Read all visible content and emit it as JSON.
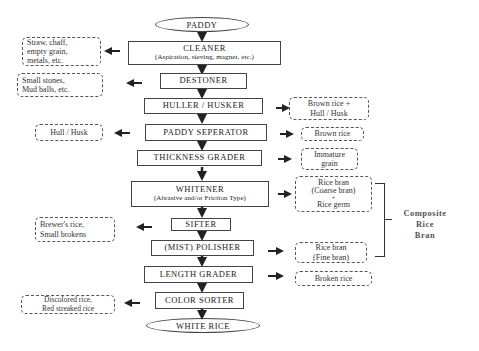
{
  "diagram": {
    "start": "PADDY",
    "end": "WHITE RICE",
    "steps": [
      {
        "name": "CLEANER",
        "sub": "(Aspiration, sieving, magnet, etc.)"
      },
      {
        "name": "DESTONER"
      },
      {
        "name": "HULLER / HUSKER"
      },
      {
        "name": "PADDY SEPERATOR"
      },
      {
        "name": "THICKNESS GRADER"
      },
      {
        "name": "WHITENER",
        "sub": "(Abrasive and/or Friction Type)"
      },
      {
        "name": "SIFTER"
      },
      {
        "name": "(MIST) POLISHER"
      },
      {
        "name": "LENGTH GRADER"
      },
      {
        "name": "COLOR SORTER"
      }
    ],
    "outputs_left": [
      {
        "step": "CLEANER",
        "lines": [
          "Straw, chaff,",
          "empty grain,",
          "metals, etc."
        ]
      },
      {
        "step": "DESTONER",
        "lines": [
          "Small stones,",
          "Mud balls, etc."
        ]
      },
      {
        "step": "PADDY SEPERATOR",
        "lines": [
          "Hull / Husk"
        ]
      },
      {
        "step": "SIFTER",
        "lines": [
          "Brewer's rice,",
          "Small brokens"
        ]
      },
      {
        "step": "COLOR SORTER",
        "lines": [
          "Discolored rice,",
          "Red streaked rice"
        ]
      }
    ],
    "outputs_right": [
      {
        "step": "HULLER / HUSKER",
        "lines": [
          "Brown rice +",
          "Hull / Husk"
        ]
      },
      {
        "step": "PADDY SEPERATOR",
        "lines": [
          "Brown rice"
        ]
      },
      {
        "step": "THICKNESS GRADER",
        "lines": [
          "Immature",
          "grain"
        ]
      },
      {
        "step": "WHITENER",
        "lines": [
          "Rice bran",
          "(Coarse bran)",
          "+",
          "Rice germ"
        ]
      },
      {
        "step": "(MIST) POLISHER",
        "lines": [
          "Rice bran",
          "(Fine bran)"
        ]
      },
      {
        "step": "LENGTH GRADER",
        "lines": [
          "Broken rice"
        ]
      }
    ],
    "group_label": [
      "Composite",
      "Rice",
      "Bran"
    ]
  }
}
